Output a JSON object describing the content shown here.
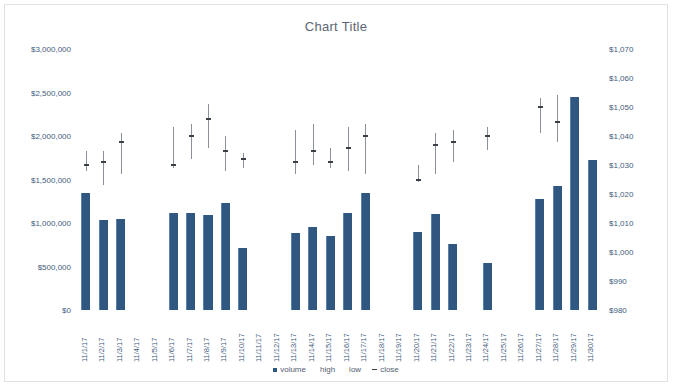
{
  "chart": {
    "title": "Chart Title"
  },
  "legend": {
    "items": [
      {
        "label": "volume",
        "marker": "square",
        "color": "#2f5780"
      },
      {
        "label": "high",
        "marker": "none",
        "color": "#8a8f98"
      },
      {
        "label": "low",
        "marker": "none",
        "color": "#8a8f98"
      },
      {
        "label": "close",
        "marker": "dash",
        "color": "#3b3f46"
      }
    ]
  },
  "chart_data": {
    "type": "bar",
    "title": "Chart Title",
    "xlabel": "",
    "ylabel": "",
    "grid": false,
    "legend_position": "bottom",
    "categories": [
      "11/1/17",
      "11/2/17",
      "11/3/17",
      "11/4/17",
      "11/5/17",
      "11/6/17",
      "11/7/17",
      "11/8/17",
      "11/9/17",
      "11/10/17",
      "11/11/17",
      "11/12/17",
      "11/13/17",
      "11/14/17",
      "11/15/17",
      "11/16/17",
      "11/17/17",
      "11/18/17",
      "11/19/17",
      "11/20/17",
      "11/21/17",
      "11/22/17",
      "11/23/17",
      "11/24/17",
      "11/25/17",
      "11/26/17",
      "11/27/17",
      "11/28/17",
      "11/29/17",
      "11/30/17"
    ],
    "left_axis": {
      "label": "",
      "ylim": [
        0,
        3000000
      ],
      "ticks": [
        0,
        500000,
        1000000,
        1500000,
        2000000,
        2500000,
        3000000
      ],
      "tick_labels": [
        "$0",
        "$500,000",
        "$1,000,000",
        "$1,500,000",
        "$2,000,000",
        "$2,500,000",
        "$3,000,000"
      ]
    },
    "right_axis": {
      "label": "",
      "ylim": [
        980,
        1070
      ],
      "ticks": [
        980,
        990,
        1000,
        1010,
        1020,
        1030,
        1040,
        1050,
        1060,
        1070
      ],
      "tick_labels": [
        "$980",
        "$990",
        "$1,000",
        "$1,010",
        "$1,020",
        "$1,030",
        "$1,040",
        "$1,050",
        "$1,060",
        "$1,070"
      ]
    },
    "series": [
      {
        "name": "volume",
        "axis": "left",
        "type": "bar",
        "color": "#2f5780",
        "values": [
          1340000,
          1040000,
          1050000,
          null,
          null,
          1110000,
          1120000,
          1090000,
          1230000,
          710000,
          null,
          null,
          880000,
          950000,
          850000,
          1120000,
          1350000,
          null,
          null,
          900000,
          1100000,
          760000,
          null,
          540000,
          null,
          null,
          1280000,
          1420000,
          2450000,
          1720000
        ]
      },
      {
        "name": "high",
        "axis": "right",
        "type": "marker",
        "color": "#8a8f98",
        "values": [
          1035,
          1035,
          1041,
          null,
          null,
          1043,
          1044,
          1051,
          1040,
          1034,
          null,
          null,
          1042,
          1044,
          1036,
          1043,
          1044,
          null,
          null,
          1030,
          1041,
          1042,
          null,
          1043,
          null,
          null,
          1053,
          1054,
          null,
          null
        ]
      },
      {
        "name": "low",
        "axis": "right",
        "type": "marker",
        "color": "#8a8f98",
        "values": [
          1028,
          1023,
          1027,
          null,
          null,
          1029,
          1032,
          1036,
          1028,
          1029,
          null,
          null,
          1027,
          1030,
          1029,
          1028,
          1027,
          null,
          null,
          1024,
          1027,
          1031,
          null,
          1035,
          null,
          null,
          1041,
          1038,
          null,
          null
        ]
      },
      {
        "name": "close",
        "axis": "right",
        "type": "close-tick",
        "color": "#3b3f46",
        "values": [
          1030,
          1031,
          1038,
          null,
          null,
          1030,
          1040,
          1046,
          1035,
          1032,
          null,
          null,
          1031,
          1035,
          1031,
          1036,
          1040,
          null,
          null,
          1025,
          1037,
          1038,
          null,
          1040,
          null,
          null,
          1050,
          1045,
          null,
          null
        ]
      }
    ]
  }
}
